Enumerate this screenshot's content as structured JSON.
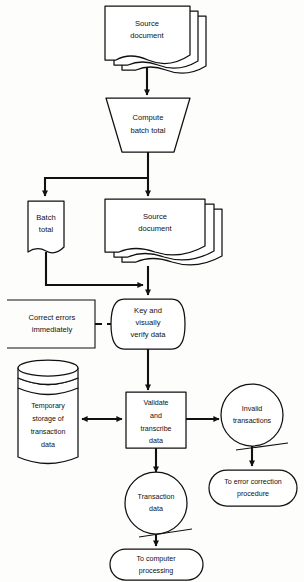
{
  "diagram": {
    "background_color": "#fdfdfb",
    "line_color": "#111111",
    "fill_color": "#ffffff"
  },
  "nodes": {
    "source_document_top": {
      "label_line1": "Source",
      "label_line2": "document",
      "shape": "multi-document"
    },
    "compute_batch_total": {
      "label_line1": "Compute",
      "label_line2": "batch total",
      "shape": "manual-operation-trapezoid"
    },
    "batch_total": {
      "label_line1": "Batch",
      "label_line2": "total",
      "shape": "document"
    },
    "source_document_mid": {
      "label_line1": "Source",
      "label_line2": "document",
      "shape": "multi-document"
    },
    "correct_errors": {
      "label_line1": "Correct errors",
      "label_line2": "immediately",
      "shape": "annotation-bracket"
    },
    "key_verify": {
      "label_line1": "Key and",
      "label_line2": "visually",
      "label_line3": "verify data",
      "shape": "manual-input-display"
    },
    "temporary_storage": {
      "label_line1": "Temporary",
      "label_line2": "storage of",
      "label_line3": "transaction",
      "label_line4": "data",
      "shape": "disk-cylinder"
    },
    "validate_transcribe": {
      "label_line1": "Validate",
      "label_line2": "and",
      "label_line3": "transcribe",
      "label_line4": "data",
      "shape": "process-rectangle"
    },
    "invalid_transactions": {
      "label_line1": "Invalid",
      "label_line2": "transactions",
      "shape": "circle"
    },
    "transaction_data": {
      "label_line1": "Transaction",
      "label_line2": "data",
      "shape": "circle"
    },
    "to_error_correction": {
      "label_line1": "To error correction",
      "label_line2": "procedure",
      "shape": "terminator-stadium"
    },
    "to_computer_processing": {
      "label_line1": "To computer",
      "label_line2": "processing",
      "shape": "terminator-stadium"
    }
  },
  "connectors": [
    {
      "name": "source-to-compute",
      "style": "solid-arrow"
    },
    {
      "name": "compute-to-split",
      "style": "solid-arrow"
    },
    {
      "name": "split-to-batch-total",
      "style": "solid-arrow"
    },
    {
      "name": "split-to-source-document",
      "style": "solid-arrow"
    },
    {
      "name": "batch-total-to-merge",
      "style": "solid-arrow"
    },
    {
      "name": "source-document-to-key",
      "style": "solid-arrow"
    },
    {
      "name": "correct-errors-to-key",
      "style": "dashed"
    },
    {
      "name": "key-to-validate",
      "style": "solid-arrow"
    },
    {
      "name": "validate-to-storage",
      "style": "double-arrow"
    },
    {
      "name": "validate-to-invalid",
      "style": "solid-arrow"
    },
    {
      "name": "validate-to-transaction-data",
      "style": "solid-arrow"
    },
    {
      "name": "invalid-to-error-correction",
      "style": "solid-arrow"
    },
    {
      "name": "transaction-data-to-processing",
      "style": "solid-arrow"
    }
  ]
}
